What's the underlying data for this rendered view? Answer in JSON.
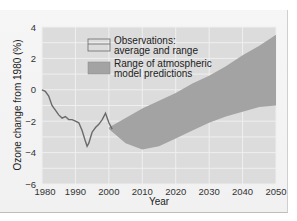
{
  "chart_data": {
    "type": "line",
    "title": "",
    "xlabel": "Year",
    "ylabel": "Ozone change from 1980 (%)",
    "xlim": [
      1980,
      2050
    ],
    "ylim": [
      -6,
      4
    ],
    "x_ticks": [
      "1980",
      "1990",
      "2000",
      "2010",
      "2020",
      "2030",
      "2040",
      "2050"
    ],
    "y_ticks": [
      "4",
      "2",
      "0",
      "−2",
      "−4",
      "−6"
    ],
    "grid": true,
    "legend_position": "upper-left-inside",
    "legend": [
      {
        "label_line1": "Observations:",
        "label_line2": "average and range",
        "style": "line"
      },
      {
        "label_line1": "Range of atmospheric",
        "label_line2": "model predictions",
        "style": "band"
      }
    ],
    "series": [
      {
        "name": "Observations: average and range",
        "kind": "line",
        "x": [
          1980,
          1981,
          1982,
          1983,
          1984,
          1985,
          1986,
          1987,
          1988,
          1989,
          1990,
          1991,
          1992,
          1993,
          1993.5,
          1994,
          1995,
          1996,
          1997,
          1998,
          1999,
          2000,
          2001
        ],
        "y": [
          0.0,
          -0.1,
          -0.4,
          -1.0,
          -1.3,
          -1.6,
          -1.8,
          -1.7,
          -1.9,
          -1.9,
          -2.0,
          -2.1,
          -2.6,
          -3.3,
          -3.6,
          -3.4,
          -2.7,
          -2.4,
          -2.2,
          -1.9,
          -1.5,
          -2.1,
          -2.5
        ]
      },
      {
        "name": "Range of atmospheric model predictions",
        "kind": "band",
        "x": [
          2000,
          2005,
          2010,
          2015,
          2020,
          2025,
          2030,
          2035,
          2040,
          2045,
          2050
        ],
        "upper": [
          -2.4,
          -1.8,
          -1.2,
          -0.7,
          -0.2,
          0.4,
          0.9,
          1.5,
          2.2,
          2.8,
          3.5
        ],
        "lower": [
          -2.5,
          -3.4,
          -3.8,
          -3.6,
          -3.1,
          -2.6,
          -2.1,
          -1.7,
          -1.4,
          -1.1,
          -1.0
        ]
      }
    ]
  },
  "colors": {
    "plot_bg": "#dcdcdc",
    "grid": "#efefef",
    "band": "#a3a3a3",
    "line": "#6a6a6a"
  }
}
